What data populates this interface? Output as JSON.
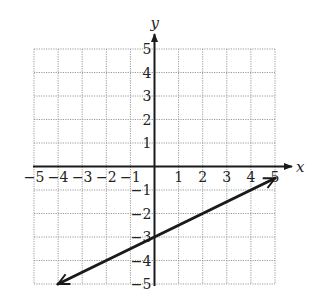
{
  "chart_data": {
    "type": "line",
    "title": "",
    "xlabel": "x",
    "ylabel": "y",
    "xlim": [
      -5,
      5
    ],
    "ylim": [
      -5,
      5
    ],
    "grid": true,
    "x_ticks": [
      -5,
      -4,
      -3,
      -2,
      -1,
      1,
      2,
      3,
      4,
      5
    ],
    "y_ticks": [
      5,
      4,
      3,
      2,
      1,
      -1,
      -2,
      -3,
      -4,
      -5
    ],
    "x_tick_labels": [
      "−5",
      "−4",
      "−3",
      "−2",
      "−1",
      "1",
      "2",
      "3",
      "4",
      "5"
    ],
    "y_tick_labels": [
      "5",
      "4",
      "3",
      "2",
      "1",
      "−1",
      "−2",
      "−3",
      "−4",
      "−5"
    ],
    "series": [
      {
        "name": "line",
        "equation": "y = 0.5x - 3",
        "slope": 0.5,
        "y_intercept": -3,
        "x": [
          -4,
          5
        ],
        "y": [
          -5,
          -0.5
        ],
        "arrows_both_ends": true,
        "color": "#1a1a1a"
      }
    ]
  },
  "colors": {
    "axis": "#1a1a1a",
    "grid": "#9a9a9a",
    "line": "#1a1a1a"
  }
}
